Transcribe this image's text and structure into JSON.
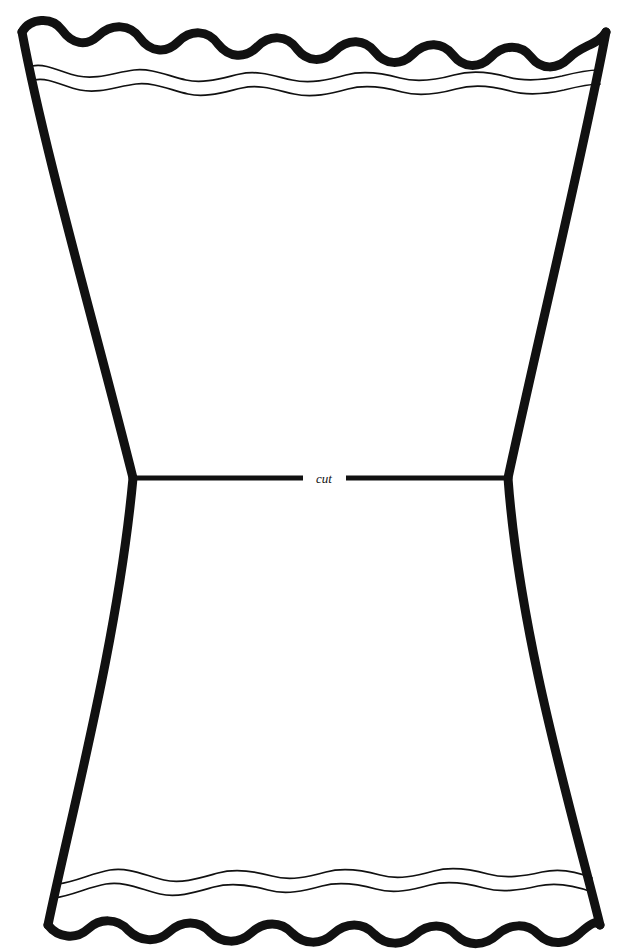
{
  "document": {
    "title": "Lampshade / Vase Cut-Out Pattern Template",
    "background_color": "#ffffff",
    "ink_color": "#111111",
    "width": 644,
    "height": 949
  },
  "labels": {
    "cut": "cut"
  },
  "shape": {
    "name": "hourglass-pattern-outline",
    "description": "Tall hourglass / flared vase silhouette with scalloped wavy top and bottom edges and concave curved left and right sides",
    "outline_stroke_width": 9,
    "detail_stroke_width": 1.6,
    "corners": {
      "top_left": [
        22,
        32
      ],
      "top_right": [
        606,
        32
      ],
      "bottom_left": [
        48,
        925
      ],
      "bottom_right": [
        600,
        925
      ],
      "waist_left": [
        133,
        478
      ],
      "waist_right": [
        508,
        478
      ]
    },
    "waves": {
      "top_thick_crests": 8,
      "top_thin_lines": 2,
      "bottom_thick_crests": 8,
      "bottom_thin_lines": 2,
      "top_thick_baseline_y": 34,
      "top_thin_line_1_y": 72,
      "top_thin_line_2_y": 86,
      "bottom_thin_line_1_y": 882,
      "bottom_thin_line_2_y": 896,
      "bottom_thick_baseline_y": 925,
      "amplitude_thick": 13,
      "amplitude_thin": 9
    }
  },
  "cut_line": {
    "name": "horizontal-cut-guide",
    "y": 478,
    "left_segment": {
      "x_start": 133,
      "x_end": 303
    },
    "right_segment": {
      "x_start": 346,
      "x_end": 508
    },
    "label_x": 324,
    "label_y": 482,
    "stroke_width": 5
  }
}
